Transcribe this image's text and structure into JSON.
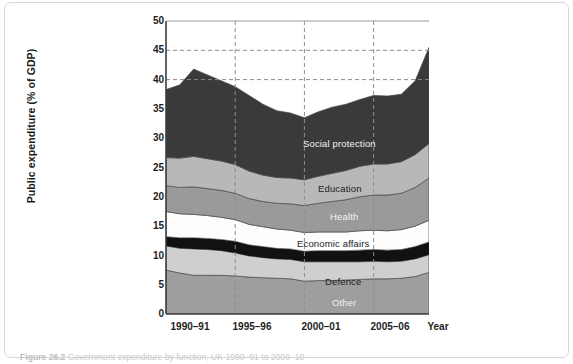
{
  "figure": {
    "caption_number": "Figure 26.2",
    "caption_text": "Government expenditure by function, UK 1990–91 to 2009–10"
  },
  "axes": {
    "ylabel": "Public expenditure (% of GDP)",
    "yticks": [
      "0",
      "5",
      "10",
      "15",
      "20",
      "25",
      "30",
      "35",
      "40",
      "45",
      "50"
    ],
    "xticks": [
      "1990–91",
      "1995–96",
      "2000–01",
      "2005–06"
    ],
    "xaxis_name": "Year"
  },
  "labels": {
    "social_protection": "Social protection",
    "education": "Education",
    "health": "Health",
    "economic_affairs": "Economic affairs",
    "defence": "Defence",
    "other": "Other"
  },
  "colors": {
    "social_protection": "#3a3a3a",
    "education": "#b8b8b8",
    "health": "#9a9a9a",
    "economic_affairs": "#fdfdfd",
    "unlabelled_black": "#111111",
    "defence": "#cfcfcf",
    "other": "#9e9e9e",
    "gridline": "#8d8d8d",
    "axis": "#3d3d3d",
    "frame": "#d8d8d8"
  },
  "chart_data": {
    "type": "area",
    "title": "",
    "xlabel": "Year",
    "ylabel": "Public expenditure (% of GDP)",
    "ylim": [
      0,
      50
    ],
    "ytick_step": 5,
    "grid": "dashed horizontal at 40 and 45; dashed vertical at 1995-96, 2000-01, 2005-06",
    "legend": "inline band labels",
    "stacked": true,
    "x": [
      "1990–91",
      "1991–92",
      "1992–93",
      "1993–94",
      "1994–95",
      "1995–96",
      "1996–97",
      "1997–98",
      "1998–99",
      "1999–00",
      "2000–01",
      "2001–02",
      "2002–03",
      "2003–04",
      "2004–05",
      "2005–06",
      "2006–07",
      "2007–08",
      "2008–09",
      "2009–10"
    ],
    "series": [
      {
        "name": "Other",
        "values": [
          7.5,
          7.0,
          6.6,
          6.6,
          6.6,
          6.5,
          6.3,
          6.2,
          6.1,
          6.0,
          5.6,
          5.7,
          5.7,
          5.8,
          5.9,
          6.0,
          6.0,
          6.1,
          6.4,
          7.1
        ]
      },
      {
        "name": "Defence",
        "values": [
          4.1,
          4.2,
          4.5,
          4.4,
          4.2,
          3.9,
          3.6,
          3.4,
          3.3,
          3.3,
          3.3,
          3.2,
          3.2,
          3.1,
          3.0,
          3.0,
          2.9,
          2.9,
          3.0,
          3.0
        ]
      },
      {
        "name": "Unlabelled (public order / debt interest)",
        "values": [
          1.6,
          1.8,
          1.9,
          1.9,
          1.9,
          2.0,
          1.9,
          1.9,
          1.8,
          1.8,
          1.8,
          1.9,
          1.9,
          1.9,
          2.0,
          2.0,
          2.0,
          2.0,
          2.1,
          2.2
        ]
      },
      {
        "name": "Economic affairs",
        "values": [
          4.3,
          4.1,
          4.0,
          3.9,
          3.8,
          3.7,
          3.5,
          3.4,
          3.3,
          3.2,
          3.2,
          3.2,
          3.2,
          3.2,
          3.3,
          3.3,
          3.3,
          3.4,
          3.5,
          3.7
        ]
      },
      {
        "name": "Health",
        "values": [
          4.4,
          4.5,
          4.7,
          4.6,
          4.6,
          4.5,
          4.4,
          4.3,
          4.4,
          4.5,
          4.6,
          4.9,
          5.2,
          5.5,
          5.8,
          6.0,
          6.1,
          6.2,
          6.6,
          7.2
        ]
      },
      {
        "name": "Education",
        "values": [
          4.8,
          5.0,
          5.2,
          5.1,
          5.0,
          4.9,
          4.7,
          4.5,
          4.4,
          4.4,
          4.4,
          4.6,
          4.8,
          5.0,
          5.2,
          5.3,
          5.3,
          5.4,
          5.6,
          5.9
        ]
      },
      {
        "name": "Social protection",
        "values": [
          11.6,
          12.5,
          14.9,
          14.3,
          13.7,
          13.3,
          12.9,
          12.1,
          11.4,
          11.1,
          10.6,
          11.0,
          11.3,
          11.3,
          11.4,
          11.7,
          11.6,
          11.5,
          12.6,
          16.4
        ]
      }
    ],
    "totals": [
      38.3,
      39.1,
      41.8,
      40.8,
      39.8,
      38.8,
      37.3,
      35.8,
      34.7,
      34.3,
      33.5,
      34.5,
      35.3,
      35.8,
      36.6,
      37.3,
      37.2,
      37.5,
      39.8,
      45.5
    ]
  }
}
